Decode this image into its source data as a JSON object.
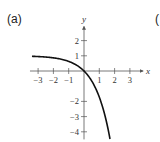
{
  "panel": {
    "label": "(a)",
    "next_label_fragment": "("
  },
  "chart_data": {
    "type": "line",
    "title": "",
    "xlabel": "x",
    "ylabel": "y",
    "xlim": [
      -3.4,
      3.6
    ],
    "ylim": [
      -4.5,
      2.8
    ],
    "grid": false,
    "x_ticks": [
      -3,
      -2,
      -1,
      1,
      2,
      3
    ],
    "x_tick_labels": [
      "−3",
      "−2",
      "−1",
      "1",
      "2",
      "3"
    ],
    "y_ticks": [
      2,
      1,
      -2,
      -3,
      -4
    ],
    "y_tick_labels": [
      "2",
      "1",
      "−2",
      "−3",
      "−4"
    ],
    "series": [
      {
        "name": "y = 1 - e^x",
        "x": [
          -3.4,
          -3,
          -2.5,
          -2,
          -1.5,
          -1,
          -0.5,
          0,
          0.5,
          1,
          1.25,
          1.5,
          1.7
        ],
        "y": [
          0.97,
          0.95,
          0.92,
          0.86,
          0.78,
          0.63,
          0.39,
          0,
          -0.65,
          -1.72,
          -2.49,
          -3.48,
          -4.47
        ]
      }
    ],
    "colors": {
      "axis": "#555555",
      "curve": "#111111"
    }
  },
  "layout": {
    "origin_px": [
      84,
      71
    ],
    "unit_x_px": 15.3,
    "unit_y_px": 15.2
  }
}
